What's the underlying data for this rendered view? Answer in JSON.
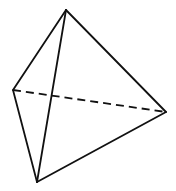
{
  "diagram": {
    "type": "tetrahedron",
    "stroke_color": "#111111",
    "background_color": "#ffffff",
    "vertices": {
      "top": [
        66,
        10
      ],
      "left": [
        13,
        90
      ],
      "right": [
        166,
        112
      ],
      "bottom": [
        37,
        182
      ]
    },
    "edges": [
      {
        "name": "top-left",
        "from": "top",
        "to": "left",
        "style": "solid"
      },
      {
        "name": "top-right",
        "from": "top",
        "to": "right",
        "style": "solid"
      },
      {
        "name": "top-bottom",
        "from": "top",
        "to": "bottom",
        "style": "solid"
      },
      {
        "name": "left-bottom",
        "from": "left",
        "to": "bottom",
        "style": "solid"
      },
      {
        "name": "bottom-right",
        "from": "bottom",
        "to": "right",
        "style": "solid"
      },
      {
        "name": "left-right",
        "from": "left",
        "to": "right",
        "style": "dashed"
      }
    ]
  }
}
